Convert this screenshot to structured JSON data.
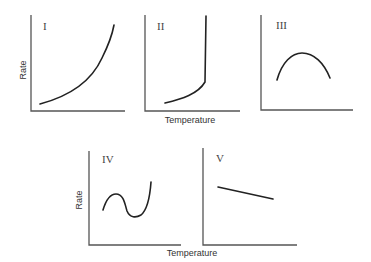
{
  "figure": {
    "type": "rate-vs-temperature panels",
    "panels": [
      {
        "id": "I",
        "label": "I",
        "shape": "exponential increase"
      },
      {
        "id": "II",
        "label": "II",
        "shape": "slow rise then abrupt vertical increase"
      },
      {
        "id": "III",
        "label": "III",
        "shape": "inverted parabola (maximum)"
      },
      {
        "id": "IV",
        "label": "IV",
        "shape": "rise, fall, then sharp rise"
      },
      {
        "id": "V",
        "label": "V",
        "shape": "linear decrease"
      }
    ],
    "labels": {
      "y_top": "Rate",
      "y_bottom": "Rate",
      "x_top": "Temperature",
      "x_bottom": "Temperature"
    }
  }
}
